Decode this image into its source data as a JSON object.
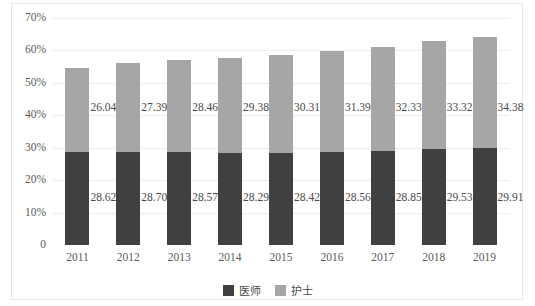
{
  "chart_data": {
    "type": "bar",
    "subtype": "stacked-bar",
    "title": "",
    "xlabel": "",
    "ylabel": "",
    "categories": [
      "2011",
      "2012",
      "2013",
      "2014",
      "2015",
      "2016",
      "2017",
      "2018",
      "2019"
    ],
    "series": [
      {
        "name": "医师",
        "color": "#404040",
        "values": [
          28.62,
          28.7,
          28.57,
          28.29,
          28.42,
          28.56,
          28.85,
          29.53,
          29.91
        ]
      },
      {
        "name": "护士",
        "color": "#a6a6a6",
        "values": [
          26.04,
          27.39,
          28.46,
          29.38,
          30.31,
          31.39,
          32.33,
          33.32,
          34.38
        ]
      }
    ],
    "totals": [
      54.66,
      56.09,
      57.03,
      57.67,
      58.73,
      59.95,
      61.18,
      62.85,
      64.29
    ],
    "ylim": [
      0,
      70
    ],
    "yticks": [
      0,
      10,
      20,
      30,
      40,
      50,
      60,
      70
    ],
    "ytick_labels": [
      "0",
      "10%",
      "20%",
      "30%",
      "40%",
      "50%",
      "60%",
      "70%"
    ],
    "grid": true,
    "legend_position": "bottom",
    "value_label_format": "2-decimal"
  },
  "legend": {
    "items": [
      {
        "label": "医师",
        "color": "#404040"
      },
      {
        "label": "护士",
        "color": "#a6a6a6"
      }
    ]
  }
}
